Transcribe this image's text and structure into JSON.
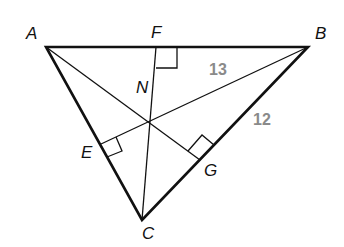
{
  "diagram": {
    "type": "triangle with altitudes",
    "vertices": {
      "A": "A",
      "B": "B",
      "C": "C"
    },
    "feet": {
      "E": "E",
      "F": "F",
      "G": "G"
    },
    "orthocenter": "N",
    "measures": {
      "NB": "13",
      "GB": "12"
    },
    "colors": {
      "line": "#111111",
      "measure": "#8a8a8a"
    }
  }
}
